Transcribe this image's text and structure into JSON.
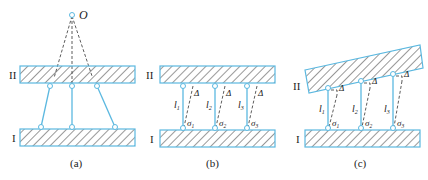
{
  "figure": {
    "panels": [
      {
        "id": "a",
        "caption": "(a)",
        "point_label": "O",
        "plate_top_label": "II",
        "plate_bottom_label": "I"
      },
      {
        "id": "b",
        "caption": "(b)",
        "plate_top_label": "II",
        "plate_bottom_label": "I",
        "rod_labels": [
          "l1",
          "l2",
          "l3"
        ],
        "rod_label_main": "l",
        "rod_label_subs": [
          "1",
          "2",
          "3"
        ],
        "stress_label_main": "σ",
        "stress_label_subs": [
          "1",
          "2",
          "3"
        ],
        "delta_label": "Δ"
      },
      {
        "id": "c",
        "caption": "(c)",
        "plate_top_label": "II",
        "plate_bottom_label": "I",
        "rod_label_main": "l",
        "rod_label_subs": [
          "1",
          "2",
          "3"
        ],
        "stress_label_main": "σ",
        "stress_label_subs": [
          "1",
          "2",
          "3"
        ],
        "delta_label": "Δ"
      }
    ],
    "colors": {
      "line_blue": "#5bb8e0",
      "hatch": "#333333",
      "text": "#222222"
    }
  }
}
